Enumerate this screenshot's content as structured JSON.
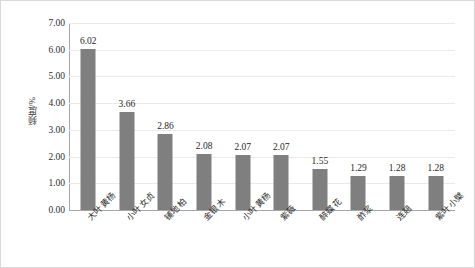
{
  "chart_data": {
    "type": "bar",
    "title": "",
    "xlabel": "",
    "ylabel": "频度/%",
    "ylim": [
      0,
      7
    ],
    "ytick_step": 1,
    "grid": true,
    "legend": null,
    "bar_color": "#7f7f7f",
    "categories": [
      "大叶黄杨",
      "小叶女贞",
      "铺地柏",
      "金银木",
      "小叶黄杨",
      "紫薇",
      "醉蝶花",
      "酢浆",
      "连翘",
      "紫叶小檗"
    ],
    "values": [
      6.02,
      3.66,
      2.86,
      2.08,
      2.07,
      2.07,
      1.55,
      1.29,
      1.28,
      1.28
    ],
    "value_labels": [
      "6.02",
      "3.66",
      "2.86",
      "2.08",
      "2.07",
      "2.07",
      "1.55",
      "1.29",
      "1.28",
      "1.28"
    ],
    "ytick_labels": [
      "0.00",
      "1.00",
      "2.00",
      "3.00",
      "4.00",
      "5.00",
      "6.00",
      "7.00"
    ],
    "ytick_values": [
      0,
      1,
      2,
      3,
      4,
      5,
      6,
      7
    ]
  }
}
